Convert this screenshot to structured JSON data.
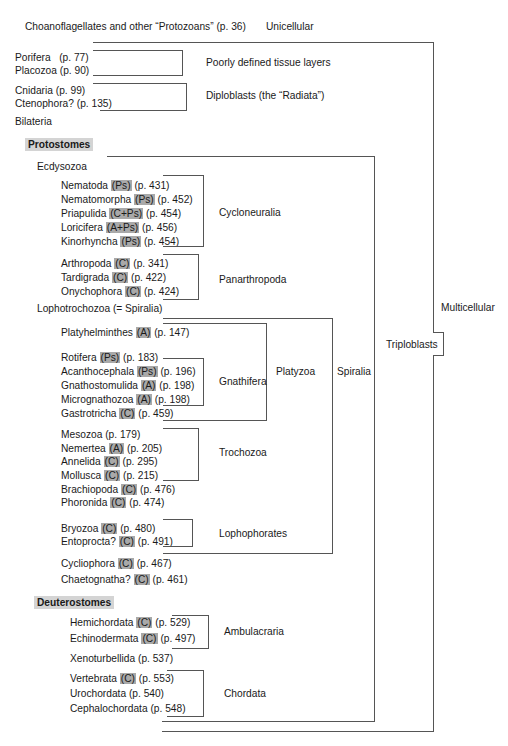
{
  "top": {
    "protozoans": "Choanoflagellates and other “Protozoans”  (p. 36)",
    "unicellular": "Unicellular",
    "multicellular": "Multicellular",
    "triploblasts": "Triploblasts",
    "poorly_defined": "Poorly defined tissue layers",
    "diploblasts": "Diploblasts (the “Radiata”)",
    "bilateria": "Bilateria"
  },
  "basal": [
    {
      "name": "Porifera",
      "page": "(p. 77)"
    },
    {
      "name": "Placozoa",
      "page": "(p. 90)"
    },
    {
      "name": "Cnidaria",
      "page": "(p. 99)"
    },
    {
      "name": "Ctenophora?",
      "page": "(p. 135)"
    }
  ],
  "protostomes": {
    "header": "Protostomes",
    "ecdysozoa": "Ecdysozoa",
    "lophotrochozoa": "Lophotrochozoa (= Spiralia)",
    "clades": {
      "cycloneuralia": "Cycloneuralia",
      "panarthropoda": "Panarthropoda",
      "gnathifera": "Gnathifera",
      "platyzoa": "Platyzoa",
      "spiralia": "Spiralia",
      "trochozoa": "Trochozoa",
      "lophophorates": "Lophophorates"
    },
    "taxa": [
      {
        "name": "Nematoda",
        "badge": "(Ps)",
        "page": "(p. 431)"
      },
      {
        "name": "Nematomorpha",
        "badge": "(Ps)",
        "page": "(p. 452)"
      },
      {
        "name": "Priapulida",
        "badge": "(C+Ps)",
        "page": "(p. 454)"
      },
      {
        "name": "Loricifera",
        "badge": "(A+Ps)",
        "page": "(p. 456)"
      },
      {
        "name": "Kinorhyncha",
        "badge": "(Ps)",
        "page": "(p. 454)"
      },
      {
        "name": "Arthropoda",
        "badge": "(C)",
        "page": "(p. 341)"
      },
      {
        "name": "Tardigrada",
        "badge": "(C)",
        "page": "(p. 422)"
      },
      {
        "name": "Onychophora",
        "badge": "(C)",
        "page": "(p. 424)"
      },
      {
        "name": "Platyhelminthes",
        "badge": "(A)",
        "page": "(p. 147)"
      },
      {
        "name": "Rotifera",
        "badge": "(Ps)",
        "page": "(p. 183)"
      },
      {
        "name": "Acanthocephala",
        "badge": "(Ps)",
        "page": "(p. 196)"
      },
      {
        "name": "Gnathostomulida",
        "badge": "(A)",
        "page": "(p. 198)"
      },
      {
        "name": "Micrognathozoa",
        "badge": "(A)",
        "page": "(p. 198)"
      },
      {
        "name": "Gastrotricha",
        "badge": "(C)",
        "page": "(p. 459)"
      },
      {
        "name": "Mesozoa",
        "badge": "",
        "page": "(p. 179)"
      },
      {
        "name": "Nemertea",
        "badge": "(A)",
        "page": "(p. 205)"
      },
      {
        "name": "Annelida",
        "badge": "(C)",
        "page": "(p. 295)"
      },
      {
        "name": "Mollusca",
        "badge": "(C)",
        "page": "(p. 215)"
      },
      {
        "name": "Brachiopoda",
        "badge": "(C)",
        "page": "(p. 476)"
      },
      {
        "name": "Phoronida",
        "badge": "(C)",
        "page": "(p. 474)"
      },
      {
        "name": "Bryozoa",
        "badge": "(C)",
        "page": "(p. 480)"
      },
      {
        "name": "Entoprocta?",
        "badge": "(C)",
        "page": "(p. 491)"
      },
      {
        "name": "Cycliophora",
        "badge": "(C)",
        "page": "(p. 467)"
      },
      {
        "name": "Chaetognatha?",
        "badge": "(C)",
        "page": "(p. 461)"
      }
    ]
  },
  "deuterostomes": {
    "header": "Deuterostomes",
    "clades": {
      "ambulacraria": "Ambulacraria",
      "chordata": "Chordata"
    },
    "taxa": [
      {
        "name": "Hemichordata",
        "badge": "(C)",
        "page": "(p. 529)"
      },
      {
        "name": "Echinodermata",
        "badge": "(C)",
        "page": "(p. 497)"
      },
      {
        "name": "Xenoturbellida",
        "badge": "",
        "page": "(p. 537)"
      },
      {
        "name": "Vertebrata",
        "badge": "(C)",
        "page": "(p. 553)"
      },
      {
        "name": "Urochordata",
        "badge": "",
        "page": "(p. 540)"
      },
      {
        "name": "Cephalochordata",
        "badge": "",
        "page": "(p. 548)"
      }
    ]
  },
  "colors": {
    "line": "#555555",
    "badge_bg": "#a9a9a9",
    "header_bg": "#d4d4d4"
  }
}
